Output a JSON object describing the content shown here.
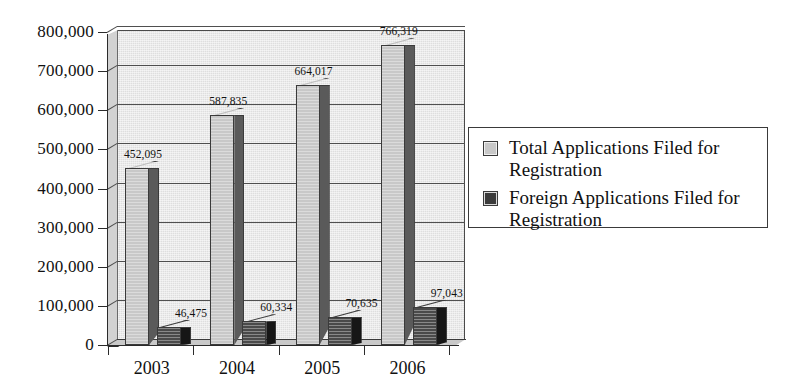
{
  "chart_data": {
    "type": "bar",
    "title": "",
    "xlabel": "",
    "ylabel": "",
    "categories": [
      "2003",
      "2004",
      "2005",
      "2006"
    ],
    "series": [
      {
        "name": "Total Applications Filed for Registration",
        "key": "total",
        "color": "#c8c8c8",
        "values": [
          452095,
          587835,
          664017,
          766319
        ],
        "labels": [
          "452,095",
          "587,835",
          "664,017",
          "766,319"
        ]
      },
      {
        "name": "Foreign Applications Filed for Registration",
        "key": "foreign",
        "color": "#3b3b3b",
        "values": [
          46475,
          60334,
          70635,
          97043
        ],
        "labels": [
          "46,475",
          "60,334",
          "70,635",
          "97,043"
        ]
      }
    ],
    "ylim": [
      0,
      800000
    ],
    "ytick_labels": [
      "800,000",
      "700,000",
      "600,000",
      "500,000",
      "400,000",
      "300,000",
      "200,000",
      "100,000",
      "0"
    ],
    "ytick_values": [
      800000,
      700000,
      600000,
      500000,
      400000,
      300000,
      200000,
      100000,
      0
    ],
    "grid": true,
    "legend_position": "right",
    "style": "3d-column"
  },
  "legend": {
    "items": [
      {
        "label": "Total Applications Filed for Registration",
        "swatch": "total"
      },
      {
        "label": "Foreign Applications Filed for Registration",
        "swatch": "foreign"
      }
    ]
  }
}
